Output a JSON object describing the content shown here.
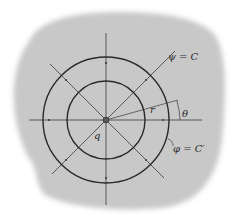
{
  "diagram": {
    "colors": {
      "background": "#ffffff",
      "region": "#c8c8c8",
      "lines": "#2e2e2e",
      "axes": "#3a3a3a"
    },
    "labels": {
      "streamline": "ψ = C",
      "equipotential": "φ = C′",
      "radius": "r",
      "angle": "θ",
      "source_strength": "q"
    },
    "center": {
      "x": 106,
      "y": 120
    },
    "circles": [
      {
        "name": "outer-equipotential",
        "radius": 63
      },
      {
        "name": "inner-equipotential",
        "radius": 39
      }
    ],
    "radial_lines_deg": [
      0,
      45,
      90,
      135,
      180,
      225,
      270,
      315
    ]
  }
}
